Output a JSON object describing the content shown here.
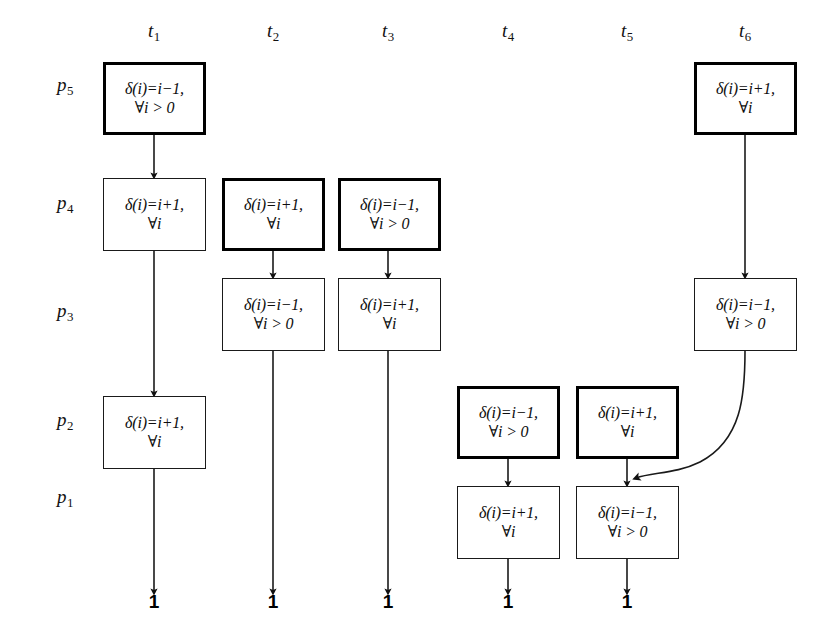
{
  "figure": {
    "background_color": "#ffffff",
    "line_color": "#1a1a1a",
    "text_color": "#0d0d0d"
  },
  "columns": [
    {
      "id": "t1",
      "label": "t",
      "sub": "1",
      "x": 154
    },
    {
      "id": "t2",
      "label": "t",
      "sub": "2",
      "x": 273
    },
    {
      "id": "t3",
      "label": "t",
      "sub": "3",
      "x": 388
    },
    {
      "id": "t4",
      "label": "t",
      "sub": "4",
      "x": 508
    },
    {
      "id": "t5",
      "label": "t",
      "sub": "5",
      "x": 627
    },
    {
      "id": "t6",
      "label": "t",
      "sub": "6",
      "x": 745
    }
  ],
  "rows": [
    {
      "id": "p5",
      "label": "p",
      "sub": "5",
      "x": 57,
      "y": 86
    },
    {
      "id": "p4",
      "label": "p",
      "sub": "4",
      "x": 57,
      "y": 204
    },
    {
      "id": "p3",
      "label": "p",
      "sub": "3",
      "x": 57,
      "y": 312
    },
    {
      "id": "p2",
      "label": "p",
      "sub": "2",
      "x": 57,
      "y": 421
    },
    {
      "id": "p1",
      "label": "p",
      "sub": "1",
      "x": 57,
      "y": 498
    }
  ],
  "boxes": [
    {
      "id": "b-t1-p5",
      "column": "t1",
      "row": "p5",
      "line1": "δ(i)=i−1,",
      "line2": "∀i > 0",
      "emphasis": "thick",
      "x": 103,
      "y": 62,
      "w": 103,
      "h": 73
    },
    {
      "id": "b-t1-p4",
      "column": "t1",
      "row": "p4",
      "line1": "δ(i)=i+1,",
      "line2": "∀i",
      "emphasis": "thin",
      "x": 103,
      "y": 178,
      "w": 103,
      "h": 73
    },
    {
      "id": "b-t1-p2",
      "column": "t1",
      "row": "p2",
      "line1": "δ(i)=i+1,",
      "line2": "∀i",
      "emphasis": "thin",
      "x": 103,
      "y": 396,
      "w": 103,
      "h": 73
    },
    {
      "id": "b-t2-p4",
      "column": "t2",
      "row": "p4",
      "line1": "δ(i)=i+1,",
      "line2": "∀i",
      "emphasis": "thick",
      "x": 222,
      "y": 178,
      "w": 103,
      "h": 73
    },
    {
      "id": "b-t2-p3",
      "column": "t2",
      "row": "p3",
      "line1": "δ(i)=i−1,",
      "line2": "∀i > 0",
      "emphasis": "thin",
      "x": 222,
      "y": 278,
      "w": 103,
      "h": 73
    },
    {
      "id": "b-t3-p4",
      "column": "t3",
      "row": "p4",
      "line1": "δ(i)=i−1,",
      "line2": "∀i > 0",
      "emphasis": "thick",
      "x": 338,
      "y": 178,
      "w": 103,
      "h": 73
    },
    {
      "id": "b-t3-p3",
      "column": "t3",
      "row": "p3",
      "line1": "δ(i)=i+1,",
      "line2": "∀i",
      "emphasis": "thin",
      "x": 338,
      "y": 278,
      "w": 103,
      "h": 73
    },
    {
      "id": "b-t4-p2",
      "column": "t4",
      "row": "p2",
      "line1": "δ(i)=i−1,",
      "line2": "∀i > 0",
      "emphasis": "thick",
      "x": 457,
      "y": 386,
      "w": 103,
      "h": 73
    },
    {
      "id": "b-t4-p1",
      "column": "t4",
      "row": "p1",
      "line1": "δ(i)=i+1,",
      "line2": "∀i",
      "emphasis": "thin",
      "x": 457,
      "y": 486,
      "w": 103,
      "h": 73
    },
    {
      "id": "b-t5-p2",
      "column": "t5",
      "row": "p2",
      "line1": "δ(i)=i+1,",
      "line2": "∀i",
      "emphasis": "thick",
      "x": 576,
      "y": 386,
      "w": 103,
      "h": 73
    },
    {
      "id": "b-t5-p1",
      "column": "t5",
      "row": "p1",
      "line1": "δ(i)=i−1,",
      "line2": "∀i > 0",
      "emphasis": "thin",
      "x": 576,
      "y": 486,
      "w": 103,
      "h": 73
    },
    {
      "id": "b-t6-p5",
      "column": "t6",
      "row": "p5",
      "line1": "δ(i)=i+1,",
      "line2": "∀i",
      "emphasis": "thick",
      "x": 694,
      "y": 62,
      "w": 103,
      "h": 73
    },
    {
      "id": "b-t6-p3",
      "column": "t6",
      "row": "p3",
      "line1": "δ(i)=i−1,",
      "line2": "∀i > 0",
      "emphasis": "thin",
      "x": 694,
      "y": 278,
      "w": 103,
      "h": 73
    }
  ],
  "terminals": [
    {
      "id": "term-t1",
      "column": "t1",
      "label": "1",
      "x": 154,
      "y": 613
    },
    {
      "id": "term-t2",
      "column": "t2",
      "label": "1",
      "x": 273,
      "y": 613
    },
    {
      "id": "term-t3",
      "column": "t3",
      "label": "1",
      "x": 388,
      "y": 613
    },
    {
      "id": "term-t4",
      "column": "t4",
      "label": "1",
      "x": 508,
      "y": 613
    },
    {
      "id": "term-t5",
      "column": "t5",
      "label": "1",
      "x": 627,
      "y": 613
    }
  ],
  "edges": [
    {
      "id": "e-t1-p5-p4",
      "kind": "straight-arrow",
      "from": "b-t1-p5",
      "to": "b-t1-p4",
      "x1": 154,
      "y1": 135,
      "x2": 154,
      "y2": 176
    },
    {
      "id": "e-t1-p4-p2",
      "kind": "straight-arrow",
      "from": "b-t1-p4",
      "to": "b-t1-p2",
      "x1": 154,
      "y1": 251,
      "x2": 154,
      "y2": 394
    },
    {
      "id": "e-t1-p2-term",
      "kind": "straight-arrow",
      "from": "b-t1-p2",
      "to": "term-t1",
      "x1": 154,
      "y1": 469,
      "x2": 154,
      "y2": 592
    },
    {
      "id": "e-t2-p4-p3",
      "kind": "straight-arrow",
      "from": "b-t2-p4",
      "to": "b-t2-p3",
      "x1": 273,
      "y1": 251,
      "x2": 273,
      "y2": 276
    },
    {
      "id": "e-t2-p3-term",
      "kind": "straight-arrow",
      "from": "b-t2-p3",
      "to": "term-t2",
      "x1": 273,
      "y1": 351,
      "x2": 273,
      "y2": 592
    },
    {
      "id": "e-t3-p4-p3",
      "kind": "straight-arrow",
      "from": "b-t3-p4",
      "to": "b-t3-p3",
      "x1": 388,
      "y1": 251,
      "x2": 388,
      "y2": 276
    },
    {
      "id": "e-t3-p3-term",
      "kind": "straight-arrow",
      "from": "b-t3-p3",
      "to": "term-t3",
      "x1": 388,
      "y1": 351,
      "x2": 388,
      "y2": 592
    },
    {
      "id": "e-t4-p2-p1",
      "kind": "straight-arrow",
      "from": "b-t4-p2",
      "to": "b-t4-p1",
      "x1": 508,
      "y1": 459,
      "x2": 508,
      "y2": 484
    },
    {
      "id": "e-t4-p1-term",
      "kind": "straight-arrow",
      "from": "b-t4-p1",
      "to": "term-t4",
      "x1": 508,
      "y1": 559,
      "x2": 508,
      "y2": 592
    },
    {
      "id": "e-t5-p2-p1",
      "kind": "straight-arrow",
      "from": "b-t5-p2",
      "to": "b-t5-p1",
      "x1": 627,
      "y1": 459,
      "x2": 627,
      "y2": 484
    },
    {
      "id": "e-t5-p1-term",
      "kind": "straight-arrow",
      "from": "b-t5-p1",
      "to": "term-t5",
      "x1": 627,
      "y1": 559,
      "x2": 627,
      "y2": 592
    },
    {
      "id": "e-t6-p5-p3",
      "kind": "straight-arrow",
      "from": "b-t6-p5",
      "to": "b-t6-p3",
      "x1": 745,
      "y1": 135,
      "x2": 745,
      "y2": 276
    },
    {
      "id": "e-t6-p3-to-t5-p1",
      "kind": "curved-arrow",
      "from": "b-t6-p3",
      "to": "b-t5-p1",
      "path": "M 745 351 C 745 395 742 440 700 462 C 676 474 652 472 636 478"
    }
  ]
}
